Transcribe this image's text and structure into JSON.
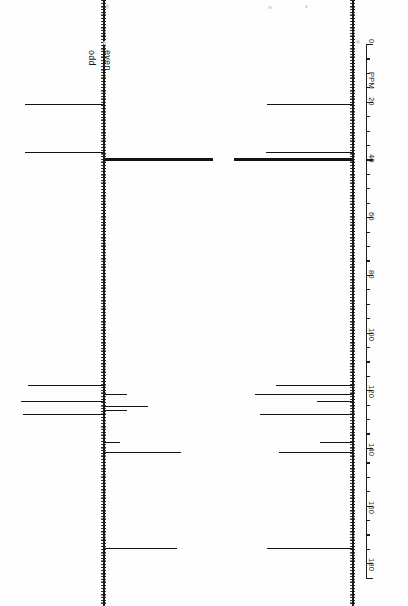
{
  "figure": {
    "kind": "nmr-spectra-pair",
    "orientation": "rotated-90",
    "background_color": "#fefefe",
    "trace_color": "#141414"
  },
  "annotations": {
    "odd_label": "odd",
    "even_label": "even"
  },
  "axis": {
    "unit_label": "PPM",
    "tick_labels": [
      "0",
      "20",
      "40",
      "60",
      "80",
      "100",
      "120",
      "140",
      "160",
      "180"
    ],
    "min_ppm": 0,
    "max_ppm": 185,
    "major_step": 20,
    "minor_step": 5,
    "direction": "increasing-downward"
  },
  "chart_data": {
    "type": "line",
    "title": "",
    "subtitle": "",
    "xlabel": "PPM",
    "ylabel": "",
    "xlim": [
      0,
      185
    ],
    "grid": false,
    "legend": [
      "odd",
      "even"
    ],
    "legend_position": "inline-top",
    "orientation": "vertical-axis-rotated",
    "series": [
      {
        "name": "left-spectrum",
        "description": "APT 13C spectrum, odd peaks up (drawn left), even peaks down (drawn right)",
        "peaks": [
          {
            "ppm": 21.0,
            "intensity": 78,
            "phase": "odd"
          },
          {
            "ppm": 37.5,
            "intensity": 78,
            "phase": "odd"
          },
          {
            "ppm": 40.0,
            "intensity": 100,
            "phase": "even"
          },
          {
            "ppm": 118.5,
            "intensity": 75,
            "phase": "odd"
          },
          {
            "ppm": 121.5,
            "intensity": 20,
            "phase": "even"
          },
          {
            "ppm": 124.0,
            "intensity": 82,
            "phase": "odd"
          },
          {
            "ppm": 125.5,
            "intensity": 40,
            "phase": "even"
          },
          {
            "ppm": 127.0,
            "intensity": 20,
            "phase": "even"
          },
          {
            "ppm": 128.5,
            "intensity": 80,
            "phase": "odd"
          },
          {
            "ppm": 138.0,
            "intensity": 14,
            "phase": "even"
          },
          {
            "ppm": 141.5,
            "intensity": 70,
            "phase": "even"
          },
          {
            "ppm": 175.0,
            "intensity": 67,
            "phase": "even"
          }
        ]
      },
      {
        "name": "right-spectrum",
        "description": "Proton-decoupled 13C spectrum, all peaks same phase",
        "peaks": [
          {
            "ppm": 21.0,
            "intensity": 72,
            "phase": "odd"
          },
          {
            "ppm": 37.5,
            "intensity": 73,
            "phase": "odd"
          },
          {
            "ppm": 40.0,
            "intensity": 100,
            "phase": "odd"
          },
          {
            "ppm": 118.5,
            "intensity": 64,
            "phase": "odd"
          },
          {
            "ppm": 121.5,
            "intensity": 82,
            "phase": "odd"
          },
          {
            "ppm": 124.0,
            "intensity": 30,
            "phase": "odd"
          },
          {
            "ppm": 128.5,
            "intensity": 78,
            "phase": "odd"
          },
          {
            "ppm": 138.0,
            "intensity": 27,
            "phase": "odd"
          },
          {
            "ppm": 141.5,
            "intensity": 62,
            "phase": "odd"
          },
          {
            "ppm": 175.0,
            "intensity": 72,
            "phase": "odd"
          }
        ]
      }
    ]
  }
}
